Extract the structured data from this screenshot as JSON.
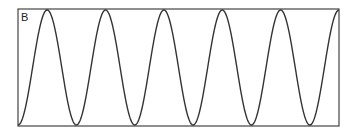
{
  "chart_data": {
    "type": "line",
    "title": "",
    "panel_label": "B",
    "xlabel": "",
    "ylabel": "",
    "grid": false,
    "legend": null,
    "series": [
      {
        "name": "oscillation",
        "function": "sinusoid",
        "cycles": 5.5,
        "start_phase": "trough",
        "end_phase": "peak",
        "ylim": [
          -1,
          1
        ]
      }
    ],
    "line_color": "#333333",
    "frame_color": "#444444"
  }
}
